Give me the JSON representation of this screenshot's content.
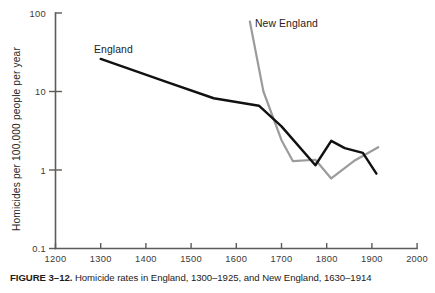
{
  "caption": {
    "label": "FIGURE 3–12.",
    "text": " Homicide rates in England, 1300–1925, and New England, 1630–1914",
    "full": "FIGURE 3–12. Homicide rates in England, 1300–1925, and New England, 1630–1914"
  },
  "axes": {
    "ylabel": "Homicides per 100,000 people per year",
    "xlabel": "",
    "y_ticks": [
      "100",
      "10",
      "1",
      "0.1"
    ],
    "x_ticks": [
      "1200",
      "1300",
      "1400",
      "1500",
      "1600",
      "1700",
      "1800",
      "1900",
      "2000"
    ]
  },
  "series_labels": {
    "england": "England",
    "new_england": "New England"
  },
  "colors": {
    "england_line": "#111111",
    "new_england_line": "#9b9b9b",
    "axis": "#5d5a58",
    "text": "#221f1f",
    "background": "#ffffff"
  },
  "chart_data": {
    "type": "line",
    "title": "",
    "subtitle": "",
    "xlabel": "",
    "ylabel": "Homicides per 100,000 people per year",
    "yscale": "log",
    "xlim": [
      1200,
      2000
    ],
    "ylim": [
      0.1,
      100
    ],
    "grid": false,
    "legend": "inline-labels",
    "xticks": [
      1200,
      1300,
      1400,
      1500,
      1600,
      1700,
      1800,
      1900,
      2000
    ],
    "yticks": [
      0.1,
      1,
      10,
      100
    ],
    "annotations": [
      {
        "text": "England",
        "x": 1330,
        "y": 33
      },
      {
        "text": "New England",
        "x": 1680,
        "y": 72
      }
    ],
    "series": [
      {
        "name": "England",
        "color": "#111111",
        "x": [
          1300,
          1450,
          1550,
          1650,
          1700,
          1775,
          1810,
          1840,
          1880,
          1910
        ],
        "y": [
          26,
          13,
          8.2,
          6.6,
          3.6,
          1.15,
          2.35,
          1.9,
          1.65,
          0.9
        ]
      },
      {
        "name": "New England",
        "color": "#9b9b9b",
        "x": [
          1630,
          1660,
          1700,
          1725,
          1775,
          1810,
          1860,
          1914
        ],
        "y": [
          78,
          10,
          2.4,
          1.3,
          1.35,
          0.78,
          1.3,
          1.95
        ]
      }
    ]
  }
}
